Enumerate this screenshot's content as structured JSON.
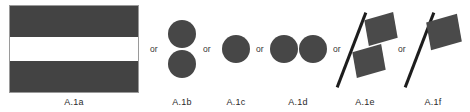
{
  "figure": {
    "background_color": "#ffffff",
    "shape_fill_color": "#474747",
    "band_light_color": "#ffffff",
    "pole_color": "#1d1d1d",
    "outline_color": "#9a9a9a"
  },
  "separators": {
    "or_1": "or",
    "or_2": "or",
    "or_3": "or",
    "or_4": "or",
    "or_5": "or"
  },
  "items": [
    {
      "id": "a1a",
      "label": "A.1a",
      "kind": "banded-rectangle-flag",
      "bands": [
        "dark",
        "light",
        "dark"
      ]
    },
    {
      "id": "a1b",
      "label": "A.1b",
      "kind": "two-circles-vertical",
      "circle_count": 2
    },
    {
      "id": "a1c",
      "label": "A.1c",
      "kind": "single-circle",
      "circle_count": 1
    },
    {
      "id": "a1d",
      "label": "A.1d",
      "kind": "two-circles-horizontal",
      "circle_count": 2
    },
    {
      "id": "a1e",
      "label": "A.1e",
      "kind": "tilted-pole-split-flag",
      "quad_count": 2
    },
    {
      "id": "a1f",
      "label": "A.1f",
      "kind": "tilted-pole-single-flag",
      "quad_count": 1
    }
  ]
}
